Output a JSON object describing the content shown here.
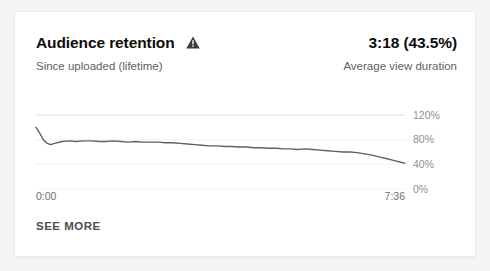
{
  "card": {
    "title": "Audience retention",
    "warning_icon": "warning-triangle-icon",
    "subtitle": "Since uploaded (lifetime)",
    "metric_value": "3:18 (43.5%)",
    "metric_label": "Average view duration",
    "see_more_label": "SEE MORE",
    "accent_color": "#606060",
    "line_color": "#606060"
  },
  "chart_data": {
    "type": "line",
    "title": "Audience retention",
    "xlabel": "",
    "ylabel": "",
    "x_tick_labels": [
      "0:00",
      "7:36"
    ],
    "y_tick_labels": [
      "0%",
      "40%",
      "80%",
      "120%"
    ],
    "y_tick_values": [
      0,
      40,
      80,
      120
    ],
    "ylim": [
      0,
      130
    ],
    "xlim": [
      0,
      456
    ],
    "x_duration_seconds": 456,
    "grid": true,
    "legend": "none",
    "series": [
      {
        "name": "Absolute audience retention",
        "x": [
          0,
          4,
          9,
          14,
          18,
          23,
          32,
          41,
          50,
          59,
          68,
          78,
          87,
          96,
          105,
          114,
          123,
          132,
          141,
          151,
          160,
          169,
          178,
          187,
          196,
          205,
          214,
          224,
          233,
          242,
          251,
          260,
          269,
          278,
          287,
          297,
          306,
          315,
          324,
          333,
          342,
          351,
          360,
          370,
          379,
          388,
          397,
          406,
          415,
          424,
          434,
          443,
          452,
          456
        ],
        "values": [
          100,
          92,
          80,
          74,
          72,
          74,
          77,
          78,
          77,
          78,
          78,
          77,
          77,
          78,
          77,
          76,
          77,
          76,
          76,
          76,
          75,
          75,
          74,
          73,
          72,
          71,
          70,
          70,
          69,
          69,
          68,
          68,
          67,
          67,
          66,
          66,
          65,
          65,
          64,
          65,
          64,
          63,
          62,
          61,
          60,
          60,
          59,
          57,
          55,
          52,
          49,
          46,
          43,
          42
        ]
      }
    ]
  }
}
